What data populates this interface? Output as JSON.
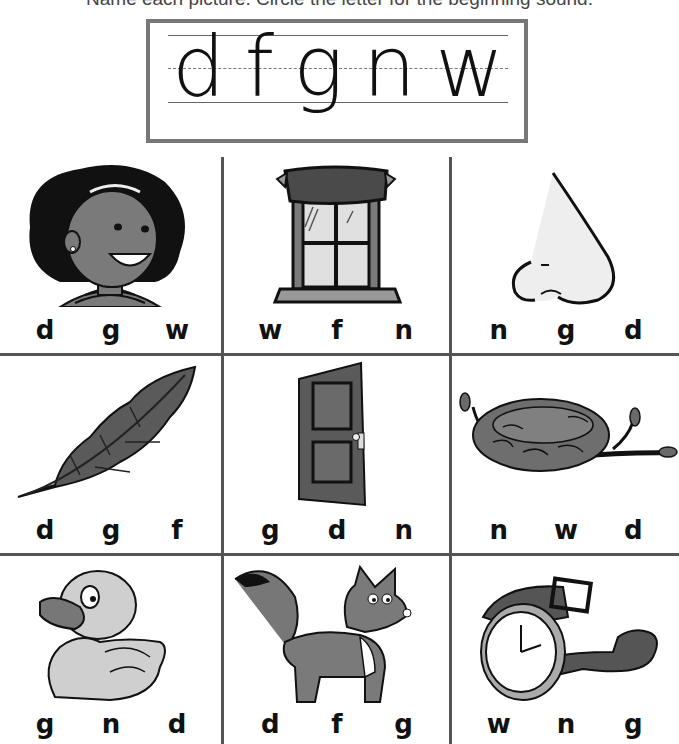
{
  "instruction": "Name each picture. Circle the letter for the beginning sound.",
  "letter_box": {
    "letters": [
      "d",
      "f",
      "g",
      "n",
      "w"
    ]
  },
  "colors": {
    "grid_line": "#555555",
    "box_border": "#777777",
    "art_dark": "#4a4a4a",
    "art_mid": "#7a7a7a",
    "art_light": "#c8c8c8"
  },
  "cells": [
    {
      "picture": "girl",
      "choices": [
        "d",
        "g",
        "w"
      ]
    },
    {
      "picture": "window",
      "choices": [
        "w",
        "f",
        "n"
      ]
    },
    {
      "picture": "nose",
      "choices": [
        "n",
        "g",
        "d"
      ]
    },
    {
      "picture": "feather",
      "choices": [
        "d",
        "g",
        "f"
      ]
    },
    {
      "picture": "door",
      "choices": [
        "g",
        "d",
        "n"
      ]
    },
    {
      "picture": "nest",
      "choices": [
        "n",
        "w",
        "d"
      ]
    },
    {
      "picture": "duck",
      "choices": [
        "g",
        "n",
        "d"
      ]
    },
    {
      "picture": "fox",
      "choices": [
        "d",
        "f",
        "g"
      ]
    },
    {
      "picture": "watch",
      "choices": [
        "w",
        "n",
        "g"
      ]
    }
  ]
}
